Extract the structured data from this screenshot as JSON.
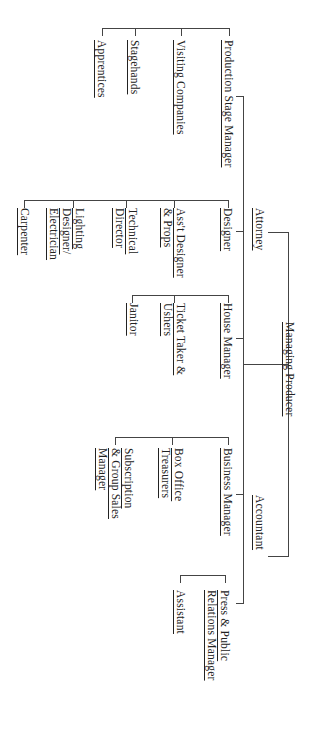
{
  "chart": {
    "orientation": "rotated-90-clockwise",
    "root": "Managing Producer",
    "nodes": {
      "managing_producer": "Managing Producer",
      "attorney": "Attorney",
      "accountant": "Accountant",
      "production_stage_manager": "Production Stage Manager",
      "visiting_companies": "Visiting Companies",
      "stagehands": "Stagehands",
      "apprentices": "Apprentices",
      "designer": "Designer",
      "asst_designer_1": "Ass't Designer",
      "asst_designer_2": "& Props",
      "technical_1": "Technical",
      "technical_2": "Director",
      "lighting_1": "Lighting",
      "lighting_2": "Designer/",
      "lighting_3": "Electrician",
      "carpenter": "Carpenter",
      "house_manager": "House Manager",
      "ticket_1": "Ticket Taker &",
      "ticket_2": "Ushers",
      "janitor": "Janitor",
      "business_manager": "Business Manager",
      "box_office_1": "Box Office",
      "box_office_2": "Treasurers",
      "subscription_1": "Subscription",
      "subscription_2": "& Group Sales",
      "subscription_3": "Manager",
      "press_1": "Press & Public",
      "press_2": "Relations Manager",
      "assistant": "Assistant"
    },
    "hierarchy": {
      "Managing Producer": [
        "Attorney",
        "Accountant",
        "Production Stage Manager",
        "Designer",
        "House Manager",
        "Business Manager",
        "Press & Public Relations Manager"
      ],
      "Production Stage Manager": [
        "Visiting Companies",
        "Stagehands",
        "Apprentices"
      ],
      "Designer": [
        "Ass't Designer & Props",
        "Technical Director",
        "Lighting Designer/Electrician",
        "Carpenter"
      ],
      "House Manager": [
        "Ticket Taker & Ushers",
        "Janitor"
      ],
      "Business Manager": [
        "Box Office Treasurers",
        "Subscription & Group Sales Manager"
      ],
      "Press & Public Relations Manager": [
        "Assistant"
      ]
    },
    "line_color": "#444444"
  }
}
